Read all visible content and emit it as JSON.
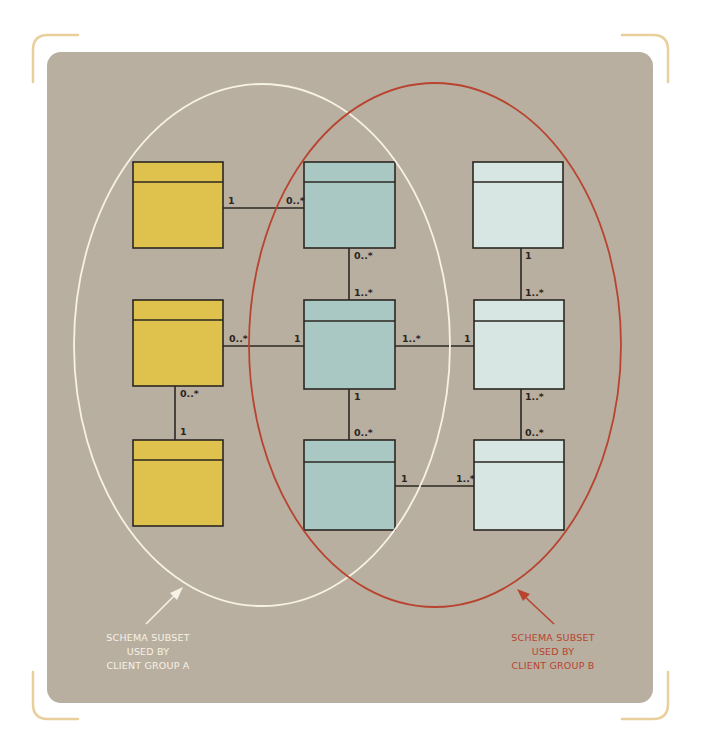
{
  "colors": {
    "page_background": "#ffffff",
    "panel_background": "#b9afa0",
    "corner_bracket": "#e8cf9c",
    "entity_outline": "#2b2722",
    "group_a_fill": "#dfc14e",
    "group_shared_fill": "#a9c8c3",
    "group_b_fill": "#d7e6e2",
    "group_a_ellipse": "#f7f2e6",
    "group_b_ellipse": "#b8442f",
    "group_a_caption": "#f7f2e6",
    "group_b_caption": "#b8442f"
  },
  "entities": [
    {
      "id": "a1",
      "group": "A",
      "x": 133,
      "y": 162,
      "w": 90,
      "h": 86,
      "header_h": 20
    },
    {
      "id": "a2",
      "group": "A",
      "x": 133,
      "y": 300,
      "w": 90,
      "h": 86,
      "header_h": 20
    },
    {
      "id": "a3",
      "group": "A",
      "x": 133,
      "y": 440,
      "w": 90,
      "h": 86,
      "header_h": 20
    },
    {
      "id": "s1",
      "group": "shared",
      "x": 304,
      "y": 162,
      "w": 91,
      "h": 86,
      "header_h": 20
    },
    {
      "id": "s2",
      "group": "shared",
      "x": 304,
      "y": 300,
      "w": 91,
      "h": 89,
      "header_h": 21
    },
    {
      "id": "s3",
      "group": "shared",
      "x": 304,
      "y": 440,
      "w": 91,
      "h": 90,
      "header_h": 22
    },
    {
      "id": "b1",
      "group": "B",
      "x": 473,
      "y": 162,
      "w": 90,
      "h": 86,
      "header_h": 20
    },
    {
      "id": "b2",
      "group": "B",
      "x": 474,
      "y": 300,
      "w": 90,
      "h": 89,
      "header_h": 21
    },
    {
      "id": "b3",
      "group": "B",
      "x": 474,
      "y": 440,
      "w": 90,
      "h": 90,
      "header_h": 22
    }
  ],
  "relationships": [
    {
      "from": "a1",
      "to": "s1",
      "from_mult": "1",
      "to_mult": "0..*"
    },
    {
      "from": "s1",
      "to": "s2",
      "from_mult": "0..*",
      "to_mult": "1..*"
    },
    {
      "from": "a2",
      "to": "s2",
      "from_mult": "0..*",
      "to_mult": "1"
    },
    {
      "from": "a2",
      "to": "a3",
      "from_mult": "0..*",
      "to_mult": "1"
    },
    {
      "from": "s2",
      "to": "b2",
      "from_mult": "1..*",
      "to_mult": "1"
    },
    {
      "from": "b1",
      "to": "b2",
      "from_mult": "1",
      "to_mult": "1..*"
    },
    {
      "from": "s2",
      "to": "s3",
      "from_mult": "1",
      "to_mult": "0..*"
    },
    {
      "from": "b2",
      "to": "b3",
      "from_mult": "1..*",
      "to_mult": "0..*"
    },
    {
      "from": "s3",
      "to": "b3",
      "from_mult": "1",
      "to_mult": "1..*"
    }
  ],
  "multiplicity_labels": {
    "a1_s1_left": "1",
    "a1_s1_right": "0..*",
    "s1_s2_top": "0..*",
    "s1_s2_bottom": "1..*",
    "a2_s2_left": "0..*",
    "a2_s2_right": "1",
    "a2_a3_top": "0..*",
    "a2_a3_bottom": "1",
    "s2_b2_left": "1..*",
    "s2_b2_right": "1",
    "b1_b2_top": "1",
    "b1_b2_bottom": "1..*",
    "s2_s3_top": "1",
    "s2_s3_bottom": "0..*",
    "b2_b3_top": "1..*",
    "b2_b3_bottom": "0..*",
    "s3_b3_left": "1",
    "s3_b3_right": "1..*"
  },
  "groups": {
    "a": {
      "caption_lines": [
        "SCHEMA SUBSET",
        "USED BY",
        "CLIENT GROUP A"
      ]
    },
    "b": {
      "caption_lines": [
        "SCHEMA SUBSET",
        "USED BY",
        "CLIENT GROUP B"
      ]
    }
  }
}
